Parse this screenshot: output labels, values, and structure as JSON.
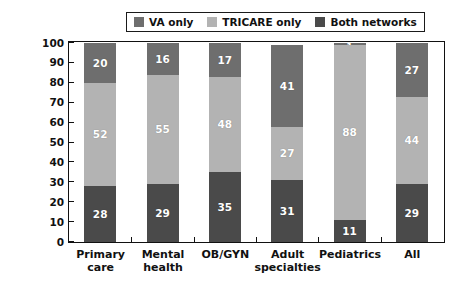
{
  "chart_data": {
    "type": "bar",
    "subtype": "stacked-column-100",
    "title": "",
    "xlabel": "",
    "ylabel": "Percent of providers",
    "ylim": [
      0,
      100
    ],
    "ytick_step": 10,
    "ytick_labels": [
      "0",
      "10",
      "20",
      "30",
      "40",
      "50",
      "60",
      "70",
      "80",
      "90",
      "100"
    ],
    "grid": false,
    "legend_position": "top-center",
    "categories": [
      "Primary care",
      "Mental health",
      "OB/GYN",
      "Adult specialties",
      "Pediatrics",
      "All"
    ],
    "category_lines": [
      [
        "Primary",
        "care"
      ],
      [
        "Mental",
        "health"
      ],
      [
        "OB/GYN",
        ""
      ],
      [
        "Adult",
        "specialties"
      ],
      [
        "Pediatrics",
        ""
      ],
      [
        "All",
        ""
      ]
    ],
    "stack_order_bottom_to_top": [
      "Both networks",
      "TRICARE only",
      "VA only"
    ],
    "series": [
      {
        "name": "Both networks",
        "color": "#4a4a4a",
        "values": [
          28,
          29,
          35,
          31,
          11,
          29
        ]
      },
      {
        "name": "TRICARE only",
        "color": "#b3b3b3",
        "values": [
          52,
          55,
          48,
          27,
          88,
          44
        ]
      },
      {
        "name": "VA only",
        "color": "#6e6e6e",
        "values": [
          20,
          16,
          17,
          41,
          1,
          27
        ]
      }
    ]
  },
  "legend": {
    "items": [
      {
        "label": "VA only",
        "color": "#6e6e6e"
      },
      {
        "label": "TRICARE only",
        "color": "#b3b3b3"
      },
      {
        "label": "Both networks",
        "color": "#4a4a4a"
      }
    ]
  },
  "axes": {
    "y_title": "Percent of providers"
  }
}
